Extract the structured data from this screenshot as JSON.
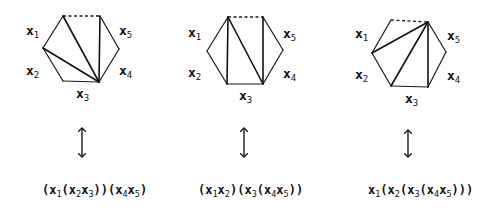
{
  "figure": {
    "panels": [
      {
        "id": "triangulation-1",
        "labels": {
          "x1": "x",
          "x1_sub": "1",
          "x2": "x",
          "x2_sub": "2",
          "x3": "x",
          "x3_sub": "3",
          "x4": "x",
          "x4_sub": "4",
          "x5": "x",
          "x5_sub": "5"
        },
        "formula": [
          {
            "t": "("
          },
          {
            "t": "x"
          },
          {
            "s": "1"
          },
          {
            "t": "("
          },
          {
            "t": "x"
          },
          {
            "s": "2"
          },
          {
            "t": "x"
          },
          {
            "s": "3"
          },
          {
            "t": "))("
          },
          {
            "t": "x"
          },
          {
            "s": "4"
          },
          {
            "t": "x"
          },
          {
            "s": "5"
          },
          {
            "t": ")"
          }
        ],
        "formula_text": "(x1(x2x3))(x4x5)",
        "arrow": "double-headed-vertical"
      },
      {
        "id": "triangulation-2",
        "labels": {
          "x1": "x",
          "x1_sub": "1",
          "x2": "x",
          "x2_sub": "2",
          "x3": "x",
          "x3_sub": "3",
          "x4": "x",
          "x4_sub": "4",
          "x5": "x",
          "x5_sub": "5"
        },
        "formula": [
          {
            "t": "("
          },
          {
            "t": "x"
          },
          {
            "s": "1"
          },
          {
            "t": "x"
          },
          {
            "s": "2"
          },
          {
            "t": ")("
          },
          {
            "t": "x"
          },
          {
            "s": "3"
          },
          {
            "t": "("
          },
          {
            "t": "x"
          },
          {
            "s": "4"
          },
          {
            "t": "x"
          },
          {
            "s": "5"
          },
          {
            "t": "))"
          }
        ],
        "formula_text": "(x1x2)(x3(x4x5))",
        "arrow": "double-headed-vertical"
      },
      {
        "id": "triangulation-3",
        "labels": {
          "x1": "x",
          "x1_sub": "1",
          "x2": "x",
          "x2_sub": "2",
          "x3": "x",
          "x3_sub": "3",
          "x4": "x",
          "x4_sub": "4",
          "x5": "x",
          "x5_sub": "5"
        },
        "formula": [
          {
            "t": "x"
          },
          {
            "s": "1"
          },
          {
            "t": "("
          },
          {
            "t": "x"
          },
          {
            "s": "2"
          },
          {
            "t": "("
          },
          {
            "t": "x"
          },
          {
            "s": "3"
          },
          {
            "t": "("
          },
          {
            "t": "x"
          },
          {
            "s": "4"
          },
          {
            "t": "x"
          },
          {
            "s": "5"
          },
          {
            "t": ")))"
          }
        ],
        "formula_text": "x1(x2(x3(x4x5)))",
        "arrow": "double-headed-vertical"
      }
    ],
    "colors": {
      "ink": "#111111",
      "background": "#ffffff"
    }
  }
}
